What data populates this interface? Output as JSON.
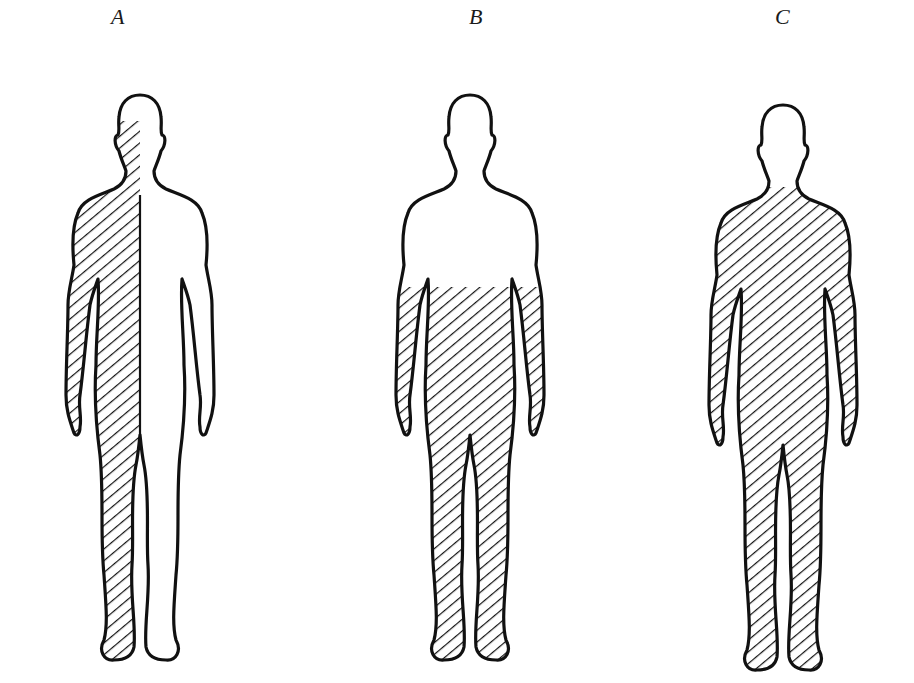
{
  "figures": [
    {
      "label": "A",
      "description": "Full-body outline with the left half of the body (viewer's left) hatched, from the eyes down to the foot",
      "hatched_region": "left half of body",
      "center_x": 140
    },
    {
      "label": "B",
      "description": "Full-body outline hatched from the waist/forearms down, including both forearms, hands, legs and feet",
      "hatched_region": "lower body below elbows",
      "center_x": 470
    },
    {
      "label": "C",
      "description": "Full-body outline hatched from the neck down, covering torso, both arms, legs and feet; head unshaded",
      "hatched_region": "entire body below neck",
      "center_x": 783
    }
  ],
  "colors": {
    "ink": "#111111",
    "background": "#ffffff"
  }
}
